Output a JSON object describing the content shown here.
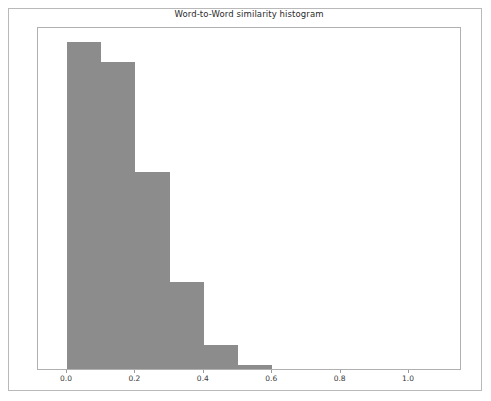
{
  "figure": {
    "title": "Word-to-Word similarity histogram",
    "background_color": "#ffffff",
    "border_color": "#b9b9b9"
  },
  "axes": {
    "frame_color": "#b0b0b0",
    "tick_color": "#9a9a9a",
    "label_color": "#3a3a3a"
  },
  "chart_data": {
    "type": "bar",
    "title": "Word-to-Word similarity histogram",
    "xlabel": "",
    "ylabel": "",
    "grid": false,
    "legend": null,
    "bar_color": "#8c8c8c",
    "bin_width": 0.1,
    "xlim": [
      -0.085,
      1.155
    ],
    "ylim": [
      0,
      1.0
    ],
    "xticks": [
      0.0,
      0.2,
      0.4,
      0.6,
      0.8,
      1.0
    ],
    "xtick_labels": [
      "0.0",
      "0.2",
      "0.4",
      "0.6",
      "0.8",
      "1.0"
    ],
    "yticks": [],
    "ytick_labels": [],
    "bin_edges": [
      0.0,
      0.1,
      0.2,
      0.3,
      0.4,
      0.5,
      0.6
    ],
    "categories": [
      "0.0-0.1",
      "0.1-0.2",
      "0.2-0.3",
      "0.3-0.4",
      "0.4-0.5",
      "0.5-0.6"
    ],
    "values": [
      0.953,
      0.895,
      0.573,
      0.254,
      0.07,
      0.012
    ]
  }
}
